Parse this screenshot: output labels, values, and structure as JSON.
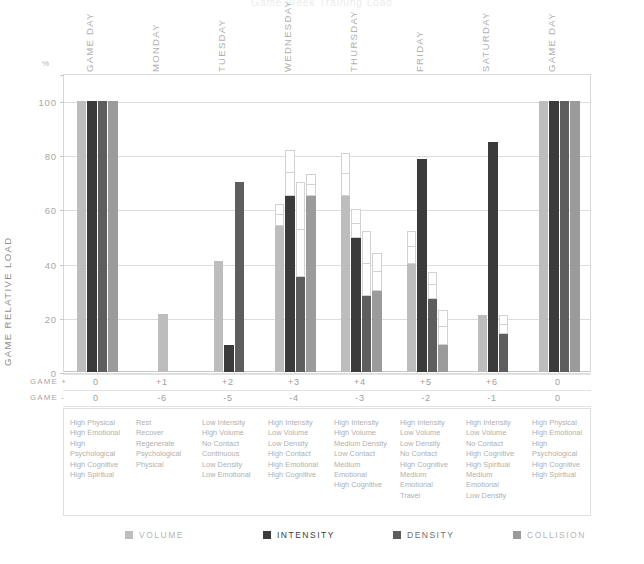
{
  "title_partial": "Game Week Training Load",
  "axis": {
    "y_unit": "%",
    "y_label": "GAME RELATIVE LOAD",
    "y_ticks": [
      0,
      20,
      40,
      60,
      80,
      100
    ],
    "y_min": 0,
    "y_max": 110
  },
  "rows": {
    "game_plus_label": "GAME +",
    "game_minus_label": "GAME -",
    "game_plus": [
      "0",
      "+1",
      "+2",
      "+3",
      "+4",
      "+5",
      "+6",
      "0"
    ],
    "game_minus": [
      "0",
      "-6",
      "-5",
      "-4",
      "-3",
      "-2",
      "-1",
      "0"
    ]
  },
  "legend": {
    "items": [
      {
        "name": "VOLUME",
        "color": "#bdbdbd"
      },
      {
        "name": "INTENSITY",
        "color": "#3b3b3b"
      },
      {
        "name": "DENSITY",
        "color": "#5e5e5e"
      },
      {
        "name": "COLLISION",
        "color": "#9b9b9b"
      }
    ]
  },
  "descriptors": [
    [
      "High Physical",
      "High Emotional",
      "High Psychological",
      "High Cognitive",
      "High Spiritual"
    ],
    [
      "Rest",
      "Recover",
      "Regenerate",
      "Psychological",
      "Physical"
    ],
    [
      "Low Intensity",
      "High Volume",
      "No Contact",
      "Continuous",
      "Low Density",
      "Low Emotional"
    ],
    [
      "High Intensity",
      "Low Volume",
      "Low Density",
      "High Contact",
      "High Emotional",
      "High Cognitive"
    ],
    [
      "High Intensity",
      "High Volume",
      "Medium Density",
      "Low Contact",
      "Medium Emotional",
      "High Cognitive"
    ],
    [
      "High Intensity",
      "Low Volume",
      "Low Density",
      "No Contact",
      "High Cognitive",
      "Medium Emotional",
      "Travel"
    ],
    [
      "High Intensity",
      "Low Volume",
      "No Contact",
      "High Cognitive",
      "High Spiritual",
      "Medium Emotional",
      "Low Density"
    ],
    [
      "High Physical",
      "High Emotional",
      "High Psychological",
      "High Cognitive",
      "High Spiritual"
    ]
  ],
  "chart_data": {
    "type": "bar",
    "title": "Game Week Training Load",
    "xlabel": "",
    "ylabel": "GAME RELATIVE LOAD",
    "yunit": "%",
    "ylim": [
      0,
      110
    ],
    "yticks": [
      0,
      20,
      40,
      60,
      80,
      100
    ],
    "grid": true,
    "legend_position": "bottom",
    "categories": [
      "GAME DAY",
      "MONDAY",
      "TUESDAY",
      "WEDNESDAY",
      "THURSDAY",
      "FRIDAY",
      "SATURDAY",
      "GAME DAY"
    ],
    "series": [
      {
        "name": "VOLUME",
        "color": "#bdbdbd",
        "values": [
          100,
          21.5,
          41,
          54,
          65,
          40,
          21,
          100
        ],
        "ghost_top": [
          100,
          21.5,
          41,
          62,
          81,
          52,
          21,
          100
        ]
      },
      {
        "name": "INTENSITY",
        "color": "#3b3b3b",
        "values": [
          100,
          null,
          10,
          65,
          49.5,
          78.5,
          85,
          100
        ],
        "ghost_top": [
          100,
          null,
          10,
          82,
          60,
          78.5,
          85,
          100
        ]
      },
      {
        "name": "DENSITY",
        "color": "#5e5e5e",
        "values": [
          100,
          null,
          70,
          35,
          28,
          27,
          14,
          100
        ],
        "ghost_top": [
          100,
          null,
          70,
          70,
          52,
          37,
          21,
          100
        ]
      },
      {
        "name": "COLLISION",
        "color": "#9b9b9b",
        "values": [
          100,
          null,
          null,
          65,
          30,
          10,
          null,
          100
        ],
        "ghost_top": [
          100,
          null,
          null,
          73,
          44,
          23,
          null,
          100
        ]
      }
    ]
  }
}
